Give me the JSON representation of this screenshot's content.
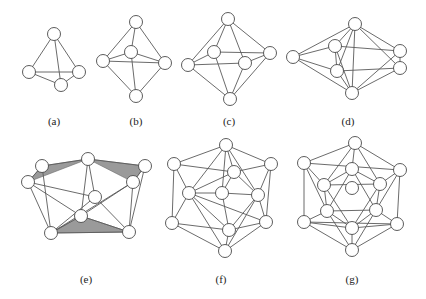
{
  "figure": {
    "panels": [
      {
        "id": "a",
        "label": "(a)",
        "label_pos": [
          54,
          122
        ]
      },
      {
        "id": "b",
        "label": "(b)",
        "label_pos": [
          136,
          122
        ]
      },
      {
        "id": "c",
        "label": "(c)",
        "label_pos": [
          229,
          122
        ]
      },
      {
        "id": "d",
        "label": "(d)",
        "label_pos": [
          348,
          122
        ]
      },
      {
        "id": "e",
        "label": "(e)",
        "label_pos": [
          86,
          280
        ]
      },
      {
        "id": "f",
        "label": "(f)",
        "label_pos": [
          221,
          280
        ]
      },
      {
        "id": "g",
        "label": "(g)",
        "label_pos": [
          352,
          280
        ]
      }
    ],
    "colors": {
      "edge": "#5a5a5a",
      "node_stroke": "#4a4a4a",
      "shaded_face": "#9a9a9a",
      "background": "#ffffff"
    },
    "node_radius": 6.5
  },
  "graphs": {
    "a": {
      "nodes": [
        [
          54,
          34
        ],
        [
          29,
          72
        ],
        [
          79,
          72
        ],
        [
          61,
          85
        ]
      ],
      "edges": [
        [
          0,
          1
        ],
        [
          0,
          2
        ],
        [
          0,
          3
        ],
        [
          1,
          2
        ],
        [
          1,
          3
        ],
        [
          2,
          3
        ]
      ]
    },
    "b": {
      "nodes": [
        [
          136,
          22
        ],
        [
          103,
          61
        ],
        [
          131,
          52
        ],
        [
          165,
          63
        ],
        [
          136,
          96
        ]
      ],
      "edges": [
        [
          0,
          1
        ],
        [
          0,
          2
        ],
        [
          0,
          3
        ],
        [
          1,
          2
        ],
        [
          2,
          3
        ],
        [
          1,
          3
        ],
        [
          1,
          4
        ],
        [
          2,
          4
        ],
        [
          3,
          4
        ]
      ]
    },
    "c": {
      "nodes": [
        [
          228,
          19
        ],
        [
          188,
          65
        ],
        [
          214,
          52
        ],
        [
          245,
          63
        ],
        [
          270,
          53
        ],
        [
          230,
          99
        ]
      ],
      "edges": [
        [
          0,
          1
        ],
        [
          0,
          2
        ],
        [
          0,
          3
        ],
        [
          0,
          4
        ],
        [
          1,
          2
        ],
        [
          2,
          4
        ],
        [
          1,
          3
        ],
        [
          3,
          4
        ],
        [
          1,
          5
        ],
        [
          2,
          5
        ],
        [
          3,
          5
        ],
        [
          4,
          5
        ]
      ]
    },
    "d": {
      "nodes": [
        [
          355,
          24
        ],
        [
          293,
          57
        ],
        [
          335,
          46
        ],
        [
          337,
          71
        ],
        [
          400,
          51
        ],
        [
          400,
          68
        ],
        [
          352,
          93
        ]
      ],
      "edges": [
        [
          0,
          1
        ],
        [
          0,
          2
        ],
        [
          0,
          3
        ],
        [
          0,
          4
        ],
        [
          0,
          5
        ],
        [
          0,
          6
        ],
        [
          1,
          2
        ],
        [
          1,
          3
        ],
        [
          1,
          6
        ],
        [
          2,
          4
        ],
        [
          3,
          5
        ],
        [
          4,
          5
        ],
        [
          2,
          6
        ],
        [
          3,
          6
        ],
        [
          4,
          6
        ],
        [
          5,
          6
        ],
        [
          2,
          3
        ]
      ]
    },
    "e": {
      "nodes": [
        [
          88,
          159
        ],
        [
          42,
          166
        ],
        [
          28,
          182
        ],
        [
          145,
          166
        ],
        [
          133,
          182
        ],
        [
          95,
          197
        ],
        [
          81,
          216
        ],
        [
          51,
          233
        ],
        [
          129,
          232
        ]
      ],
      "edges": [
        [
          0,
          1
        ],
        [
          1,
          2
        ],
        [
          0,
          3
        ],
        [
          3,
          4
        ],
        [
          0,
          5
        ],
        [
          0,
          6
        ],
        [
          2,
          5
        ],
        [
          2,
          7
        ],
        [
          2,
          6
        ],
        [
          4,
          6
        ],
        [
          4,
          8
        ],
        [
          3,
          8
        ],
        [
          6,
          7
        ],
        [
          6,
          8
        ],
        [
          7,
          8
        ],
        [
          5,
          8
        ],
        [
          1,
          7
        ],
        [
          4,
          7
        ],
        [
          5,
          7
        ]
      ],
      "faces": [
        [
          [
            42,
            166
          ],
          [
            88,
            159
          ],
          [
            28,
            182
          ]
        ],
        [
          [
            88,
            159
          ],
          [
            145,
            166
          ],
          [
            133,
            182
          ]
        ],
        [
          [
            51,
            233
          ],
          [
            81,
            216
          ],
          [
            129,
            232
          ]
        ]
      ]
    },
    "f": {
      "nodes": [
        [
          226,
          145
        ],
        [
          174,
          164
        ],
        [
          271,
          164
        ],
        [
          234,
          172
        ],
        [
          189,
          193
        ],
        [
          222,
          193
        ],
        [
          258,
          195
        ],
        [
          172,
          223
        ],
        [
          266,
          222
        ],
        [
          229,
          230
        ],
        [
          225,
          251
        ]
      ],
      "edges": [
        [
          0,
          1
        ],
        [
          0,
          2
        ],
        [
          0,
          3
        ],
        [
          0,
          4
        ],
        [
          0,
          5
        ],
        [
          0,
          6
        ],
        [
          1,
          4
        ],
        [
          1,
          7
        ],
        [
          1,
          3
        ],
        [
          2,
          6
        ],
        [
          2,
          8
        ],
        [
          2,
          3
        ],
        [
          3,
          5
        ],
        [
          3,
          6
        ],
        [
          3,
          4
        ],
        [
          4,
          5
        ],
        [
          5,
          6
        ],
        [
          4,
          7
        ],
        [
          4,
          9
        ],
        [
          6,
          8
        ],
        [
          6,
          9
        ],
        [
          5,
          9
        ],
        [
          7,
          10
        ],
        [
          8,
          10
        ],
        [
          9,
          10
        ],
        [
          4,
          10
        ],
        [
          6,
          10
        ],
        [
          7,
          9
        ],
        [
          8,
          9
        ],
        [
          4,
          8
        ]
      ]
    },
    "g": {
      "nodes": [
        [
          355,
          143
        ],
        [
          304,
          163
        ],
        [
          400,
          170
        ],
        [
          352,
          169
        ],
        [
          324,
          185
        ],
        [
          380,
          184
        ],
        [
          352,
          188
        ],
        [
          327,
          211
        ],
        [
          376,
          210
        ],
        [
          304,
          222
        ],
        [
          397,
          224
        ],
        [
          352,
          228
        ],
        [
          352,
          250
        ]
      ],
      "edges": [
        [
          0,
          1
        ],
        [
          0,
          2
        ],
        [
          0,
          3
        ],
        [
          0,
          4
        ],
        [
          0,
          5
        ],
        [
          1,
          4
        ],
        [
          1,
          9
        ],
        [
          1,
          2
        ],
        [
          2,
          5
        ],
        [
          2,
          10
        ],
        [
          3,
          4
        ],
        [
          3,
          5
        ],
        [
          4,
          7
        ],
        [
          5,
          8
        ],
        [
          4,
          5
        ],
        [
          7,
          8
        ],
        [
          4,
          11
        ],
        [
          5,
          11
        ],
        [
          3,
          7
        ],
        [
          3,
          8
        ],
        [
          7,
          11
        ],
        [
          8,
          11
        ],
        [
          7,
          9
        ],
        [
          8,
          10
        ],
        [
          9,
          11
        ],
        [
          10,
          11
        ],
        [
          9,
          12
        ],
        [
          10,
          12
        ],
        [
          11,
          12
        ],
        [
          7,
          12
        ],
        [
          8,
          12
        ],
        [
          9,
          10
        ],
        [
          1,
          7
        ],
        [
          2,
          8
        ]
      ],
      "hidden_center": 6
    }
  }
}
